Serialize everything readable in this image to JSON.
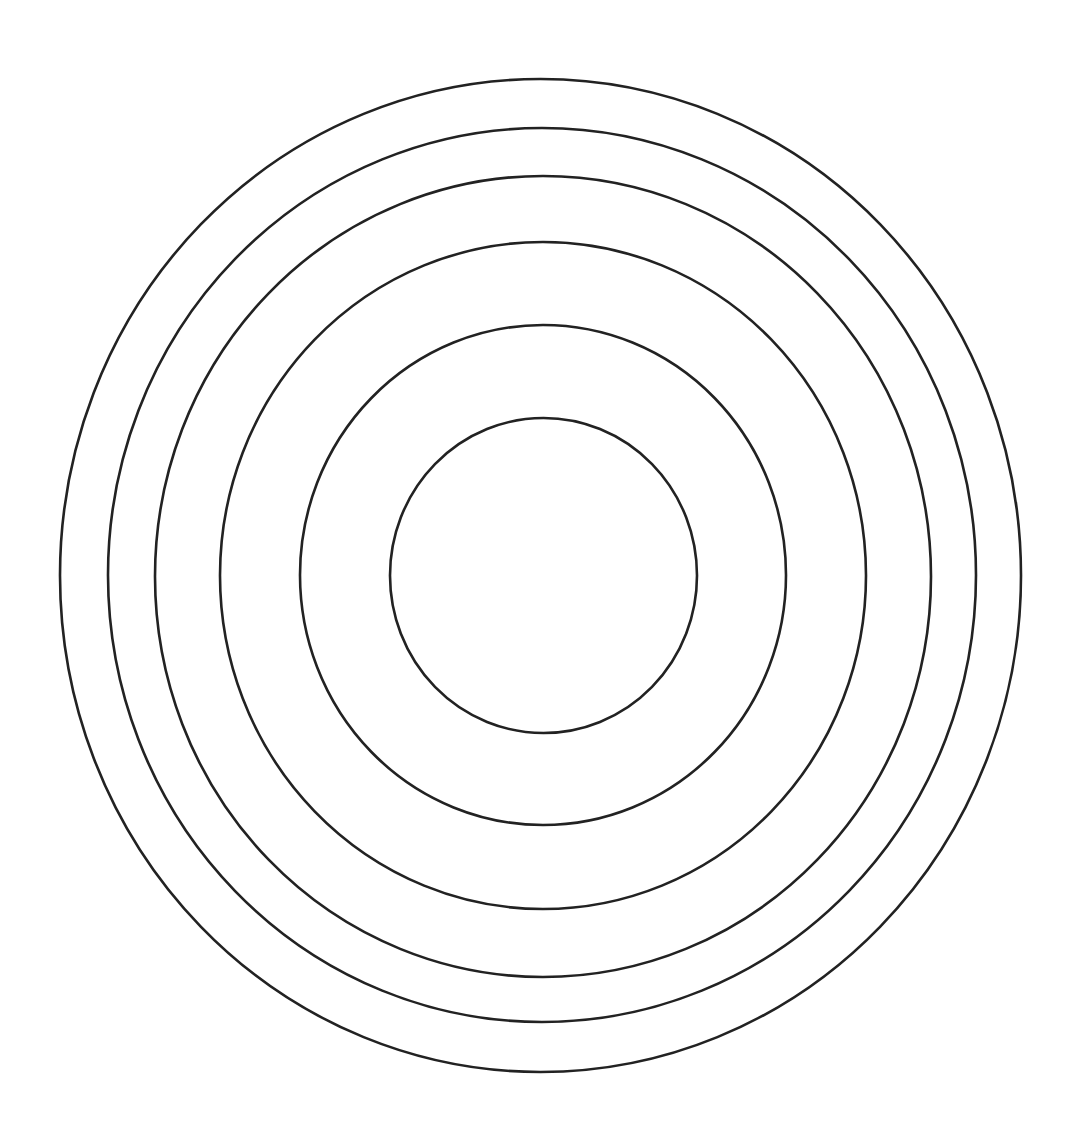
{
  "diagram": {
    "type": "concentric-rings",
    "background": "#ffffff",
    "stroke_color": "#222222",
    "stroke_width": 2.6,
    "ring_count": 6,
    "rings": [
      {
        "name": "ring-1-innermost",
        "cx": 543.5,
        "cy": 575.5,
        "rx": 153.5,
        "ry": 157.5
      },
      {
        "name": "ring-2",
        "cx": 543,
        "cy": 575,
        "rx": 243,
        "ry": 250
      },
      {
        "name": "ring-3",
        "cx": 543,
        "cy": 575.5,
        "rx": 323,
        "ry": 333.5
      },
      {
        "name": "ring-4",
        "cx": 543,
        "cy": 576.5,
        "rx": 388,
        "ry": 400.5
      },
      {
        "name": "ring-5",
        "cx": 542,
        "cy": 575,
        "rx": 434,
        "ry": 447
      },
      {
        "name": "ring-6-outermost",
        "cx": 540.5,
        "cy": 575.5,
        "rx": 480.5,
        "ry": 496.5
      }
    ]
  }
}
